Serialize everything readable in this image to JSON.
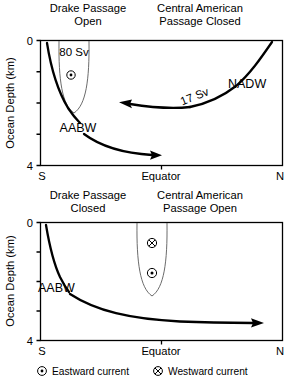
{
  "figure": {
    "type": "ocean-circulation-schematic",
    "panels": [
      {
        "id": "top",
        "titles": {
          "left_line1": "Drake Passage",
          "left_line2": "Open",
          "right_line1": "Central American",
          "right_line2": "Passage Closed"
        },
        "axes": {
          "ylabel": "Ocean Depth (km)",
          "ytick_top": "0",
          "ytick_bottom": "4",
          "ylim": [
            0,
            4
          ],
          "yticks": [
            0,
            1,
            2,
            3,
            4
          ],
          "xticks": [
            "S",
            "Equator",
            "N"
          ],
          "xtick_left": "S",
          "xtick_center": "Equator",
          "xtick_right": "N"
        },
        "annotations": [
          {
            "name": "drake-transport",
            "text": "80 Sv"
          },
          {
            "name": "nadw-transport",
            "text": "17 Sv"
          },
          {
            "name": "nadw-label",
            "text": "NADW"
          },
          {
            "name": "aabw-label",
            "text": "AABW"
          }
        ],
        "current_symbols": [
          {
            "name": "eastward-symbol",
            "kind": "eastward"
          }
        ]
      },
      {
        "id": "bottom",
        "titles": {
          "left_line1": "Drake Passage",
          "left_line2": "Closed",
          "right_line1": "Central American",
          "right_line2": "Passage Open"
        },
        "axes": {
          "ylabel": "Ocean Depth (km)",
          "ytick_top": "0",
          "ytick_bottom": "4",
          "ylim": [
            0,
            4
          ],
          "yticks": [
            0,
            1,
            2,
            3,
            4
          ],
          "xticks": [
            "S",
            "Equator",
            "N"
          ],
          "xtick_left": "S",
          "xtick_center": "Equator",
          "xtick_right": "N"
        },
        "annotations": [
          {
            "name": "aabw-label",
            "text": "AABW"
          }
        ],
        "current_symbols": [
          {
            "name": "westward-symbol",
            "kind": "westward"
          },
          {
            "name": "eastward-symbol",
            "kind": "eastward"
          }
        ]
      }
    ],
    "legend": {
      "items": [
        {
          "symbol": "eastward",
          "label": "Eastward current"
        },
        {
          "symbol": "westward",
          "label": "Westward current"
        }
      ]
    },
    "colors": {
      "ink": "#000000",
      "gyre_outline": "#5a5a5a",
      "background": "#ffffff"
    }
  }
}
